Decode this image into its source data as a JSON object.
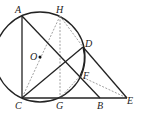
{
  "diagram": {
    "type": "geometry",
    "circle": {
      "center": "O",
      "cx": 40,
      "cy": 57,
      "r": 45
    },
    "points": {
      "A": {
        "label": "A",
        "x": 22,
        "y": 16
      },
      "H": {
        "label": "H",
        "x": 60,
        "y": 16
      },
      "D": {
        "label": "D",
        "x": 83,
        "y": 47
      },
      "O": {
        "label": "O",
        "x": 40,
        "y": 57
      },
      "F": {
        "label": "F",
        "x": 80,
        "y": 76
      },
      "C": {
        "label": "C",
        "x": 22,
        "y": 98
      },
      "G": {
        "label": "G",
        "x": 60,
        "y": 98
      },
      "B": {
        "label": "B",
        "x": 100,
        "y": 98
      },
      "E": {
        "label": "E",
        "x": 127,
        "y": 98
      }
    },
    "solid_segments": [
      [
        "A",
        "C"
      ],
      [
        "A",
        "B"
      ],
      [
        "C",
        "E"
      ],
      [
        "C",
        "D"
      ],
      [
        "D",
        "E"
      ],
      [
        "D",
        "F"
      ]
    ],
    "dashed_segments": [
      [
        "H",
        "G"
      ],
      [
        "H",
        "C"
      ],
      [
        "H",
        "D"
      ],
      [
        "F",
        "E"
      ],
      [
        "F",
        "G"
      ]
    ],
    "colors": {
      "stroke": "#222222",
      "dashed": "#777777",
      "background": "#ffffff"
    }
  }
}
